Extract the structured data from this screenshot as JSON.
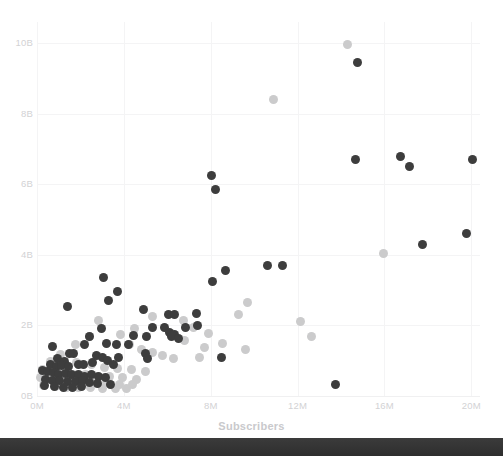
{
  "chart_data": {
    "type": "scatter",
    "title": "",
    "xlabel": "Subscribers",
    "ylabel": "",
    "xlim": [
      0,
      20400000
    ],
    "ylim": [
      0,
      10600000000
    ],
    "grid": true,
    "legend": "none",
    "x_ticks": [
      "0M",
      "4M",
      "8M",
      "12M",
      "16M",
      "20M"
    ],
    "x_tick_values": [
      0,
      4000000,
      8000000,
      12000000,
      16000000,
      20000000
    ],
    "y_ticks": [
      "0B",
      "2B",
      "4B",
      "6B",
      "8B",
      "10B"
    ],
    "y_tick_values": [
      0,
      2000000000,
      4000000000,
      6000000000,
      8000000000,
      10000000000
    ],
    "series": [
      {
        "name": "series-dark",
        "color": "#3d3d3d",
        "marker": "circle",
        "marker_size": 9,
        "points": [
          [
            14750000,
            9450000000
          ],
          [
            13750000,
            330000000
          ],
          [
            8050000,
            6250000000
          ],
          [
            8200000,
            5850000000
          ],
          [
            14650000,
            6700000000
          ],
          [
            16750000,
            6800000000
          ],
          [
            17150000,
            6500000000
          ],
          [
            20050000,
            6700000000
          ],
          [
            17750000,
            4300000000
          ],
          [
            19800000,
            4600000000
          ],
          [
            10600000,
            3700000000
          ],
          [
            11300000,
            3700000000
          ],
          [
            8700000,
            3550000000
          ],
          [
            8100000,
            3250000000
          ],
          [
            3050000,
            3350000000
          ],
          [
            3700000,
            2950000000
          ],
          [
            3300000,
            2700000000
          ],
          [
            1400000,
            2550000000
          ],
          [
            4900000,
            2450000000
          ],
          [
            6050000,
            2300000000
          ],
          [
            6350000,
            2300000000
          ],
          [
            7350000,
            2350000000
          ],
          [
            6850000,
            1950000000
          ],
          [
            7400000,
            2000000000
          ],
          [
            5300000,
            1950000000
          ],
          [
            5850000,
            1950000000
          ],
          [
            6100000,
            1800000000
          ],
          [
            6350000,
            1750000000
          ],
          [
            6200000,
            1680000000
          ],
          [
            6500000,
            1620000000
          ],
          [
            5050000,
            1700000000
          ],
          [
            4450000,
            1720000000
          ],
          [
            2950000,
            1900000000
          ],
          [
            2400000,
            1700000000
          ],
          [
            2200000,
            1450000000
          ],
          [
            3200000,
            1500000000
          ],
          [
            3650000,
            1450000000
          ],
          [
            4200000,
            1450000000
          ],
          [
            5000000,
            1200000000
          ],
          [
            5100000,
            1050000000
          ],
          [
            8500000,
            1100000000
          ],
          [
            700000,
            1400000000
          ],
          [
            1500000,
            1200000000
          ],
          [
            1700000,
            1200000000
          ],
          [
            950000,
            1050000000
          ],
          [
            1250000,
            980000000
          ],
          [
            600000,
            880000000
          ],
          [
            900000,
            850000000
          ],
          [
            1150000,
            860000000
          ],
          [
            1450000,
            850000000
          ],
          [
            1900000,
            900000000
          ],
          [
            2150000,
            880000000
          ],
          [
            2550000,
            950000000
          ],
          [
            2750000,
            1150000000
          ],
          [
            3000000,
            1080000000
          ],
          [
            3250000,
            1000000000
          ],
          [
            3500000,
            900000000
          ],
          [
            3750000,
            1100000000
          ],
          [
            250000,
            730000000
          ],
          [
            500000,
            700000000
          ],
          [
            750000,
            680000000
          ],
          [
            1000000,
            620000000
          ],
          [
            1300000,
            640000000
          ],
          [
            1600000,
            600000000
          ],
          [
            1900000,
            620000000
          ],
          [
            2200000,
            560000000
          ],
          [
            2500000,
            600000000
          ],
          [
            2850000,
            560000000
          ],
          [
            3150000,
            520000000
          ],
          [
            400000,
            480000000
          ],
          [
            700000,
            450000000
          ],
          [
            1050000,
            430000000
          ],
          [
            1400000,
            420000000
          ],
          [
            1750000,
            400000000
          ],
          [
            2100000,
            430000000
          ],
          [
            2400000,
            380000000
          ],
          [
            2800000,
            350000000
          ],
          [
            350000,
            300000000
          ],
          [
            800000,
            280000000
          ],
          [
            1200000,
            250000000
          ],
          [
            1650000,
            230000000
          ],
          [
            2050000,
            260000000
          ],
          [
            3400000,
            320000000
          ]
        ]
      },
      {
        "name": "series-light",
        "color": "#cbcbcc",
        "marker": "circle",
        "marker_size": 9,
        "points": [
          [
            14300000,
            9950000000
          ],
          [
            10900000,
            8400000000
          ],
          [
            15950000,
            4050000000
          ],
          [
            9700000,
            2650000000
          ],
          [
            9300000,
            2300000000
          ],
          [
            12150000,
            2100000000
          ],
          [
            12650000,
            1700000000
          ],
          [
            8550000,
            1500000000
          ],
          [
            9600000,
            1320000000
          ],
          [
            2850000,
            2150000000
          ],
          [
            5300000,
            2250000000
          ],
          [
            6750000,
            2150000000
          ],
          [
            7200000,
            1950000000
          ],
          [
            7900000,
            1780000000
          ],
          [
            6800000,
            1580000000
          ],
          [
            7700000,
            1380000000
          ],
          [
            4500000,
            1900000000
          ],
          [
            3850000,
            1750000000
          ],
          [
            2400000,
            1700000000
          ],
          [
            1750000,
            1450000000
          ],
          [
            4250000,
            1450000000
          ],
          [
            4800000,
            1320000000
          ],
          [
            5300000,
            1220000000
          ],
          [
            5800000,
            1150000000
          ],
          [
            6300000,
            1050000000
          ],
          [
            7500000,
            1080000000
          ],
          [
            1100000,
            1180000000
          ],
          [
            600000,
            980000000
          ],
          [
            1800000,
            960000000
          ],
          [
            2500000,
            880000000
          ],
          [
            3100000,
            820000000
          ],
          [
            3700000,
            780000000
          ],
          [
            4350000,
            740000000
          ],
          [
            5000000,
            700000000
          ],
          [
            250000,
            760000000
          ],
          [
            700000,
            700000000
          ],
          [
            1200000,
            650000000
          ],
          [
            1700000,
            620000000
          ],
          [
            2250000,
            600000000
          ],
          [
            2800000,
            560000000
          ],
          [
            3350000,
            560000000
          ],
          [
            3950000,
            520000000
          ],
          [
            4600000,
            480000000
          ],
          [
            150000,
            520000000
          ],
          [
            550000,
            470000000
          ],
          [
            1000000,
            440000000
          ],
          [
            1500000,
            420000000
          ],
          [
            2000000,
            400000000
          ],
          [
            2600000,
            380000000
          ],
          [
            3200000,
            370000000
          ],
          [
            3800000,
            340000000
          ],
          [
            4400000,
            320000000
          ],
          [
            300000,
            300000000
          ],
          [
            850000,
            270000000
          ],
          [
            1350000,
            250000000
          ],
          [
            1900000,
            240000000
          ],
          [
            2450000,
            230000000
          ],
          [
            3000000,
            220000000
          ],
          [
            3600000,
            210000000
          ],
          [
            4100000,
            200000000
          ]
        ]
      }
    ]
  },
  "axis": {
    "x_title": "Subscribers"
  },
  "clipped_header": {
    "text": ""
  },
  "colors": {
    "background": "#ffffff",
    "grid": "#f4f4f5",
    "tick_text": "#d2d2d4",
    "axis_title": "#c9c9cc",
    "series_dark": "#3d3d3d",
    "series_light": "#cbcbcc",
    "bottom_bar": "#353535"
  }
}
